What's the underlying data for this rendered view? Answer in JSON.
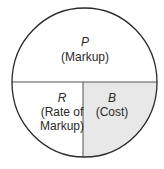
{
  "diagram": {
    "type": "markup-circle",
    "colors": {
      "stroke": "#2a2a2a",
      "divider": "#555555",
      "shaded_fill": "#e8e8e8",
      "background": "#ffffff",
      "text": "#2a2a2a"
    },
    "top": {
      "variable": "P",
      "label": "(Markup)"
    },
    "bottom_left": {
      "variable": "R",
      "label_line1": "(Rate of",
      "label_line2": "Markup)"
    },
    "bottom_right": {
      "variable": "B",
      "label": "(Cost)",
      "shaded": true
    }
  }
}
